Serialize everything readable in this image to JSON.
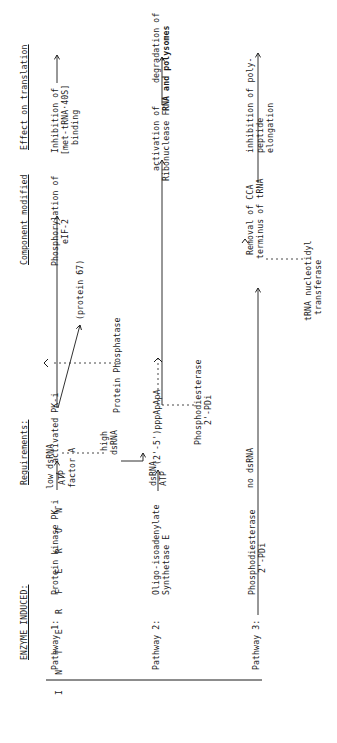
{
  "side_label": "I N T E R F E R O N",
  "headers": {
    "enzyme": "ENZYME INDUCED:",
    "requirements": "Requirements:",
    "component": "Component modified",
    "effect": "Effect on translation"
  },
  "pathway1": {
    "label": "Pathway 1:",
    "enzyme": "Protein kinase PK-i",
    "req_top": "low dsRNA",
    "req_bottom": "ATP",
    "cofactor": "factor A",
    "high_line1": "high",
    "high_line2": "dsRNA",
    "product": "activated PK-i",
    "component_line1": "Phosphorylation of",
    "component_line2": "eIF-2",
    "protein": "(protein 67)",
    "phosphatase": "Protein Phosphatase",
    "effect_line1": "Inhibition of",
    "effect_line2": "[met-tRNA·40S]",
    "effect_line3": "binding"
  },
  "pathway2": {
    "label": "Pathway 2:",
    "enzyme_line1": "Oligo-isoadenylate",
    "enzyme_line2": "Synthetase E",
    "req_top": "dsRNA",
    "req_bottom": "ATP",
    "product": "(2'-5')pppApApA",
    "pde_line1": "Phosphodiesterase",
    "pde_line2": "2'-PDi",
    "component_line1": "activation of",
    "component_line2": "Ribonuclease F",
    "effect_line1": "degradation of",
    "effect_line2": "RNA and polysomes"
  },
  "pathway3": {
    "label": "Pathway 3:",
    "enzyme_line1": "Phosphodiesterase",
    "enzyme_line2": "2'-PDi",
    "req": "no dsRNA",
    "component_line1": "Removal of CCA",
    "component_line2": "terminus of tRNA",
    "transferase_line1": "tRNA nucleotidyl",
    "transferase_line2": "transferase",
    "effect_line1": "inhibition of poly-",
    "effect_line2": "peptide",
    "effect_line3": "elongation"
  }
}
